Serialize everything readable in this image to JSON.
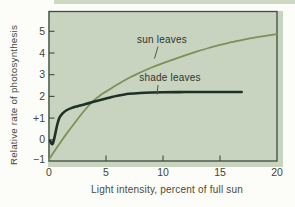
{
  "figure": {
    "kind": "scanned textbook chart"
  },
  "chart_data": {
    "type": "line",
    "title": "",
    "xlabel": "Light intensity, percent of full sun",
    "ylabel": "Relative rate of photosynthesis",
    "xlim": [
      0,
      20
    ],
    "ylim": [
      -1,
      6
    ],
    "grid": false,
    "legend": "inline-labels-with-leader-lines",
    "x_ticks": [
      0,
      5,
      10,
      15,
      20
    ],
    "x_tick_labels": [
      "0",
      "5",
      "10",
      "15",
      "20"
    ],
    "y_ticks": [
      -1,
      0,
      1,
      2,
      3,
      4,
      5
    ],
    "y_tick_labels": [
      "−1",
      "0",
      "+1",
      "2",
      "3",
      "4",
      "5"
    ],
    "series": [
      {
        "name": "sun leaves",
        "color": "#7c9156",
        "stroke_width": 1.8,
        "points": [
          [
            0,
            -0.9
          ],
          [
            0.5,
            -0.5
          ],
          [
            1,
            -0.12
          ],
          [
            1.5,
            0.25
          ],
          [
            2,
            0.6
          ],
          [
            2.5,
            0.95
          ],
          [
            3,
            1.28
          ],
          [
            3.5,
            1.58
          ],
          [
            4,
            1.85
          ],
          [
            4.5,
            2.05
          ],
          [
            5,
            2.22
          ],
          [
            6,
            2.55
          ],
          [
            7,
            2.85
          ],
          [
            8,
            3.1
          ],
          [
            9,
            3.33
          ],
          [
            10,
            3.53
          ],
          [
            11,
            3.72
          ],
          [
            12,
            3.9
          ],
          [
            13,
            4.07
          ],
          [
            14,
            4.23
          ],
          [
            15,
            4.37
          ],
          [
            16,
            4.5
          ],
          [
            17,
            4.61
          ],
          [
            18,
            4.71
          ],
          [
            19,
            4.79
          ],
          [
            20,
            4.87
          ]
        ]
      },
      {
        "name": "shade leaves",
        "color": "#1f3024",
        "stroke_width": 2.6,
        "points": [
          [
            0.1,
            -0.05
          ],
          [
            0.3,
            -0.2
          ],
          [
            0.5,
            0.15
          ],
          [
            0.7,
            0.65
          ],
          [
            0.9,
            1.0
          ],
          [
            1.2,
            1.22
          ],
          [
            1.5,
            1.35
          ],
          [
            2,
            1.47
          ],
          [
            2.5,
            1.55
          ],
          [
            3,
            1.62
          ],
          [
            3.5,
            1.69
          ],
          [
            4,
            1.76
          ],
          [
            4.5,
            1.83
          ],
          [
            5,
            1.9
          ],
          [
            5.5,
            1.97
          ],
          [
            6,
            2.03
          ],
          [
            6.5,
            2.08
          ],
          [
            7,
            2.12
          ],
          [
            8,
            2.16
          ],
          [
            9,
            2.18
          ],
          [
            10,
            2.19
          ],
          [
            12,
            2.2
          ],
          [
            14,
            2.2
          ],
          [
            16.9,
            2.2
          ]
        ]
      }
    ]
  },
  "colors": {
    "page_bg": "#fcfcf8",
    "panel_bg": "#c8d4c0",
    "top_strip": "#cdd9c4",
    "frame": "#3e4b40",
    "tick_text": "#43453c",
    "title_text": "#4a4b42",
    "leader_line": "#4e5c42"
  }
}
